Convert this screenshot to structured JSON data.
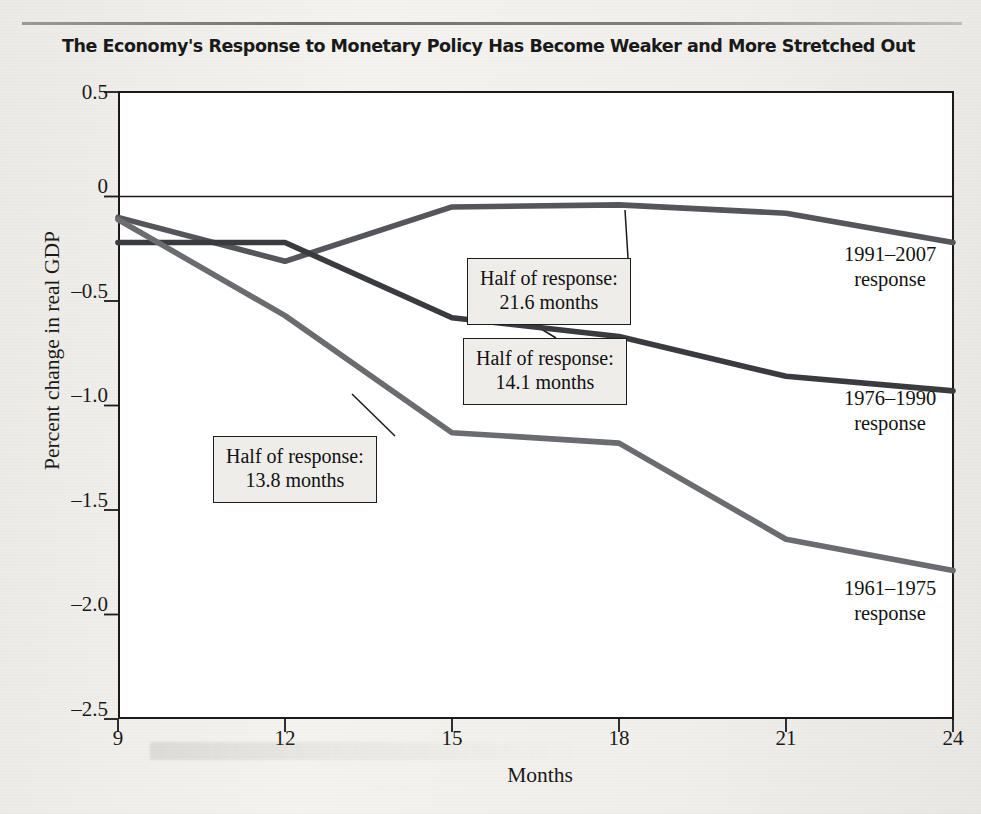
{
  "figure": {
    "title": "The Economy's Response to Monetary Policy Has Become Weaker and More Stretched Out"
  },
  "chart_data": {
    "type": "line",
    "title": "The Economy's Response to Monetary Policy Has Become Weaker and More Stretched Out",
    "xlabel": "Months",
    "ylabel": "Percent change in real GDP",
    "x": [
      9,
      12,
      15,
      18,
      21,
      24
    ],
    "xlim": [
      9,
      24
    ],
    "ylim": [
      -2.5,
      0.5
    ],
    "xticks": [
      "9",
      "12",
      "15",
      "18",
      "21",
      "24"
    ],
    "yticks": [
      "0.5",
      "0",
      "–0.5",
      "–1.0",
      "–1.5",
      "–2.0",
      "–2.5"
    ],
    "ytick_values": [
      0.5,
      0,
      -0.5,
      -1.0,
      -1.5,
      -2.0,
      -2.5
    ],
    "grid": false,
    "legend_position": "right-inline",
    "zero_line": true,
    "series": [
      {
        "name": "1991–2007 response",
        "color": "#55565a",
        "values": [
          -0.1,
          -0.31,
          -0.05,
          -0.04,
          -0.08,
          -0.22
        ]
      },
      {
        "name": "1976–1990 response",
        "color": "#3a3b3f",
        "values": [
          -0.22,
          -0.22,
          -0.58,
          -0.67,
          -0.86,
          -0.93
        ]
      },
      {
        "name": "1961–1975 response",
        "color": "#6b6c70",
        "values": [
          -0.11,
          -0.57,
          -1.13,
          -1.18,
          -1.64,
          -1.79
        ]
      }
    ],
    "annotations": [
      {
        "id": "half-response-21-6",
        "line1": "Half of response:",
        "line2": "21.6 months",
        "series": "1991–2007 response",
        "months": 21.6
      },
      {
        "id": "half-response-14-1",
        "line1": "Half of response:",
        "line2": "14.1 months",
        "series": "1976–1990 response",
        "months": 14.1
      },
      {
        "id": "half-response-13-8",
        "line1": "Half of response:",
        "line2": "13.8 months",
        "series": "1961–1975 response",
        "months": 13.8
      }
    ],
    "series_labels": [
      {
        "line1": "1991–2007",
        "line2": "response"
      },
      {
        "line1": "1976–1990",
        "line2": "response"
      },
      {
        "line1": "1961–1975",
        "line2": "response"
      }
    ]
  }
}
